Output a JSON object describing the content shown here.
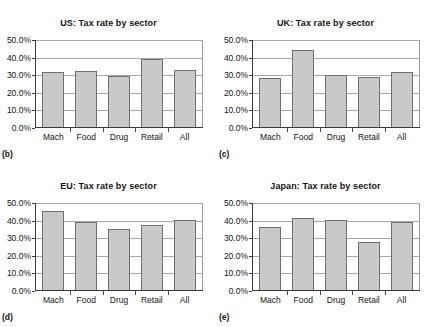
{
  "figure": {
    "panels": [
      {
        "tag": "(b)",
        "title": "US: Tax rate by sector",
        "chart_data": {
          "type": "bar",
          "title": "US: Tax rate by sector",
          "xlabel": "",
          "ylabel": "",
          "categories": [
            "Mach",
            "Food",
            "Drug",
            "Retail",
            "All"
          ],
          "values": [
            32.0,
            32.2,
            29.5,
            39.0,
            33.2
          ],
          "ylim": [
            0,
            50
          ],
          "yticks": [
            0,
            10,
            20,
            30,
            40,
            50
          ],
          "ytick_labels": [
            "0.0%",
            "10.0%",
            "20.0%",
            "30.0%",
            "40.0%",
            "50.0%"
          ],
          "grid": true,
          "legend": "none"
        }
      },
      {
        "tag": "(c)",
        "title": "UK: Tax rate by sector",
        "chart_data": {
          "type": "bar",
          "title": "UK: Tax rate by sector",
          "xlabel": "",
          "ylabel": "",
          "categories": [
            "Mach",
            "Food",
            "Drug",
            "Retail",
            "All"
          ],
          "values": [
            28.4,
            44.6,
            30.4,
            28.8,
            32.1
          ],
          "ylim": [
            0,
            50
          ],
          "yticks": [
            0,
            10,
            20,
            30,
            40,
            50
          ],
          "ytick_labels": [
            "0.0%",
            "10.0%",
            "20.0%",
            "30.0%",
            "40.0%",
            "50.0%"
          ],
          "grid": true,
          "legend": "none"
        }
      },
      {
        "tag": "(d)",
        "title": "EU: Tax rate by sector",
        "chart_data": {
          "type": "bar",
          "title": "EU: Tax rate by sector",
          "xlabel": "",
          "ylabel": "",
          "categories": [
            "Mach",
            "Food",
            "Drug",
            "Retail",
            "All"
          ],
          "values": [
            45.6,
            39.3,
            35.1,
            37.3,
            40.1
          ],
          "ylim": [
            0,
            50
          ],
          "yticks": [
            0,
            10,
            20,
            30,
            40,
            50
          ],
          "ytick_labels": [
            "0.0%",
            "10.0%",
            "20.0%",
            "30.0%",
            "40.0%",
            "50.0%"
          ],
          "grid": true,
          "legend": "none"
        }
      },
      {
        "tag": "(e)",
        "title": "Japan: Tax rate by sector",
        "chart_data": {
          "type": "bar",
          "title": "Japan: Tax rate by sector",
          "xlabel": "",
          "ylabel": "",
          "categories": [
            "Mach",
            "Food",
            "Drug",
            "Retail",
            "All"
          ],
          "values": [
            36.3,
            41.6,
            40.3,
            27.9,
            39.0
          ],
          "ylim": [
            0,
            50
          ],
          "yticks": [
            0,
            10,
            20,
            30,
            40,
            50
          ],
          "ytick_labels": [
            "0.0%",
            "10.0%",
            "20.0%",
            "30.0%",
            "40.0%",
            "50.0%"
          ],
          "grid": true,
          "legend": "none"
        }
      }
    ],
    "style": {
      "bar_fill": "#c9c9c9",
      "bar_stroke": "#6f6f6f",
      "grid_color": "#a8a8a8",
      "axis_color": "#3a3a3a",
      "text_color": "#141414",
      "background": "#ffffff"
    }
  },
  "chart_data": [
    {
      "type": "bar",
      "title": "US: Tax rate by sector",
      "categories": [
        "Mach",
        "Food",
        "Drug",
        "Retail",
        "All"
      ],
      "values": [
        32.0,
        32.2,
        29.5,
        39.0,
        33.2
      ],
      "xlabel": "",
      "ylabel": "",
      "ylim": [
        0,
        50
      ]
    },
    {
      "type": "bar",
      "title": "UK: Tax rate by sector",
      "categories": [
        "Mach",
        "Food",
        "Drug",
        "Retail",
        "All"
      ],
      "values": [
        28.4,
        44.6,
        30.4,
        28.8,
        32.1
      ],
      "xlabel": "",
      "ylabel": "",
      "ylim": [
        0,
        50
      ]
    },
    {
      "type": "bar",
      "title": "EU: Tax rate by sector",
      "categories": [
        "Mach",
        "Food",
        "Drug",
        "Retail",
        "All"
      ],
      "values": [
        45.6,
        39.3,
        35.1,
        37.3,
        40.1
      ],
      "xlabel": "",
      "ylabel": "",
      "ylim": [
        0,
        50
      ]
    },
    {
      "type": "bar",
      "title": "Japan: Tax rate by sector",
      "categories": [
        "Mach",
        "Food",
        "Drug",
        "Retail",
        "All"
      ],
      "values": [
        36.3,
        41.6,
        40.3,
        27.9,
        39.0
      ],
      "xlabel": "",
      "ylabel": "",
      "ylim": [
        0,
        50
      ]
    }
  ]
}
